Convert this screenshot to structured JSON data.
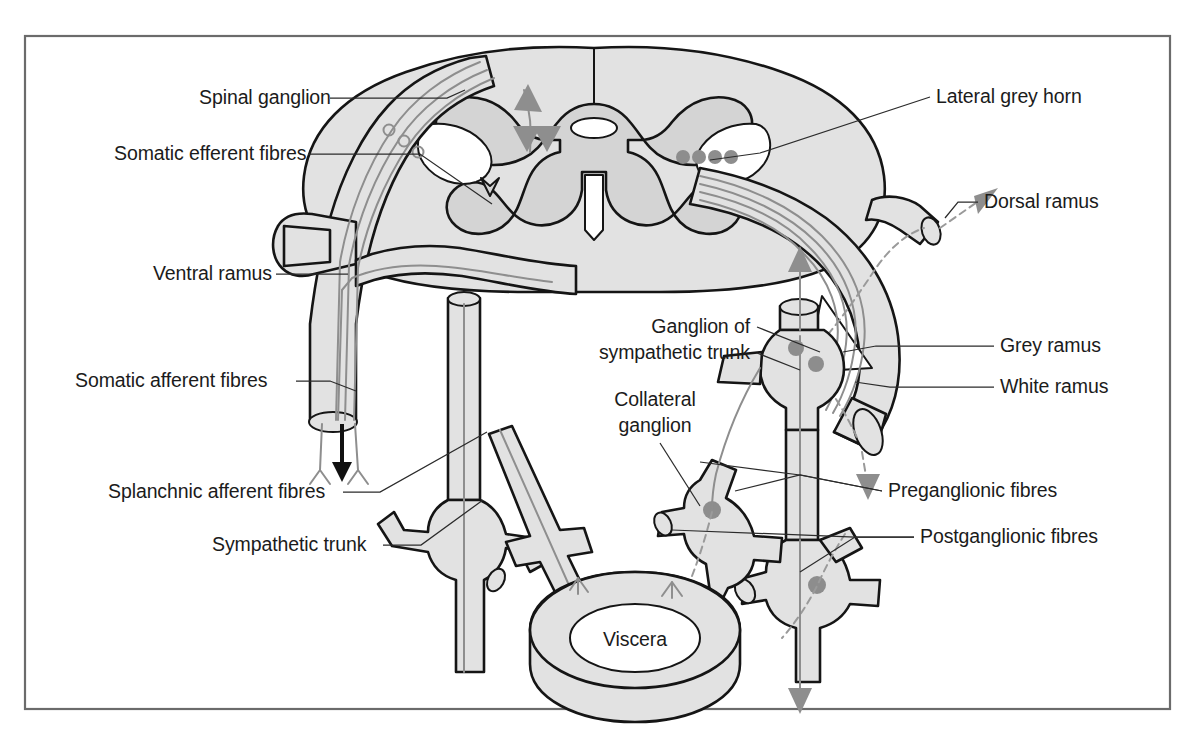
{
  "figure": {
    "border_color": "#6b6b6b",
    "background_color": "#ffffff"
  },
  "palette": {
    "nerve_fill": "#e2e2e2",
    "grey_matter": "#d4d4d4",
    "outline": "#151515",
    "fibre_grey": "#8e8e8e",
    "arrow_black": "#111111",
    "label_text": "#1b1b1b",
    "leader_line": "#2b2b2b"
  },
  "labels": [
    {
      "id": "spinal-ganglion",
      "text": "Spinal ganglion",
      "x": 199,
      "y": 104,
      "anchor": "start"
    },
    {
      "id": "somatic-efferent",
      "text": "Somatic efferent fibres",
      "x": 114,
      "y": 160,
      "anchor": "start"
    },
    {
      "id": "ventral-ramus",
      "text": "Ventral ramus",
      "x": 153,
      "y": 280,
      "anchor": "start"
    },
    {
      "id": "somatic-afferent",
      "text": "Somatic afferent fibres",
      "x": 75,
      "y": 387,
      "anchor": "start"
    },
    {
      "id": "splanchnic-afferent",
      "text": "Splanchnic afferent fibres",
      "x": 108,
      "y": 498,
      "anchor": "start"
    },
    {
      "id": "sympathetic-trunk",
      "text": "Sympathetic trunk",
      "x": 212,
      "y": 551,
      "anchor": "start"
    },
    {
      "id": "lateral-grey-horn",
      "text": "Lateral grey horn",
      "x": 936,
      "y": 103,
      "anchor": "start"
    },
    {
      "id": "dorsal-ramus",
      "text": "Dorsal ramus",
      "x": 984,
      "y": 208,
      "anchor": "start"
    },
    {
      "id": "grey-ramus",
      "text": "Grey ramus",
      "x": 1000,
      "y": 352,
      "anchor": "start"
    },
    {
      "id": "white-ramus",
      "text": "White ramus",
      "x": 1000,
      "y": 393,
      "anchor": "start"
    },
    {
      "id": "preganglionic-fibres",
      "text": "Preganglionic fibres",
      "x": 888,
      "y": 497,
      "anchor": "start"
    },
    {
      "id": "postganglionic-fibres",
      "text": "Postganglionic fibres",
      "x": 920,
      "y": 543,
      "anchor": "start"
    },
    {
      "id": "collateral-ganglion-1",
      "text": "Collateral",
      "x": 655,
      "y": 406,
      "anchor": "middle"
    },
    {
      "id": "collateral-ganglion-2",
      "text": "ganglion",
      "x": 655,
      "y": 432,
      "anchor": "middle"
    },
    {
      "id": "ganglion-symp-trunk-1",
      "text": "Ganglion of",
      "x": 750,
      "y": 333,
      "anchor": "end"
    },
    {
      "id": "ganglion-symp-trunk-2",
      "text": "sympathetic trunk",
      "x": 750,
      "y": 359,
      "anchor": "end"
    },
    {
      "id": "viscera",
      "text": "Viscera",
      "x": 635,
      "y": 646,
      "anchor": "middle"
    }
  ],
  "leader_lines": [
    {
      "id": "leader-spinal-ganglion",
      "points": "330,98 447,98 465,90"
    },
    {
      "id": "leader-somatic-efferent",
      "points": "308,154 420,154 492,204"
    },
    {
      "id": "leader-ventral-ramus",
      "points": "276,274 348,274"
    },
    {
      "id": "leader-somatic-afferent",
      "points": "296,381 330,381 356,391"
    },
    {
      "id": "leader-splanchnic-afferent",
      "points": "343,492 380,492 487,432"
    },
    {
      "id": "leader-sympathetic-trunk",
      "points": "383,545 421,545 483,500"
    },
    {
      "id": "leader-lateral-grey-horn",
      "points": "930,97 760,153 710,160"
    },
    {
      "id": "leader-dorsal-ramus",
      "points": "978,202 958,202 945,218"
    },
    {
      "id": "leader-grey-ramus",
      "points": "994,346 876,346 843,352"
    },
    {
      "id": "leader-white-ramus",
      "points": "994,387 890,387 855,382"
    },
    {
      "id": "leader-preganglionic-a",
      "points": "882,491 800,475 735,491"
    },
    {
      "id": "leader-preganglionic-b",
      "points": "882,491 800,475 700,462"
    },
    {
      "id": "leader-postganglionic-a",
      "points": "914,537 855,537 800,572"
    },
    {
      "id": "leader-postganglionic-b",
      "points": "914,537 855,537 672,530"
    },
    {
      "id": "leader-collateral-ganglion",
      "points": "660,443 700,506"
    },
    {
      "id": "leader-ganglion-symp-trunk",
      "points": "757,327 820,352"
    },
    {
      "id": "leader-ganglion-symp-trunk-2",
      "points": "757,353 800,370"
    }
  ],
  "anatomy": {
    "spinal_cord": {
      "name": "spinal-cord-cross-section",
      "grey_matter_name": "grey-matter-butterfly",
      "central_canal_name": "central-canal"
    },
    "cell_bodies": {
      "lateral_horn_count": 4,
      "spinal_ganglion_count": 3,
      "sympathetic_trunk_ganglion_count": 2,
      "collateral_ganglion_count": 1,
      "lower_ganglion_count": 1
    },
    "arrows": [
      {
        "id": "arrow-somatic-efferent-down",
        "direction": "down",
        "color": "#111111"
      },
      {
        "id": "arrow-dorsal-ramus-out",
        "direction": "up-right",
        "color": "#8e8e8e"
      },
      {
        "id": "arrow-ventral-ramus-down",
        "direction": "down",
        "color": "#8e8e8e"
      },
      {
        "id": "arrow-trunk-down",
        "direction": "down",
        "color": "#8e8e8e"
      },
      {
        "id": "arrow-trunk-up",
        "direction": "up",
        "color": "#8e8e8e"
      },
      {
        "id": "arrow-cord-afferent-in",
        "direction": "up",
        "color": "#8e8e8e"
      },
      {
        "id": "arrow-cord-afferent-branch",
        "direction": "down",
        "color": "#8e8e8e"
      }
    ],
    "viscera_ring_name": "viscera-torus"
  }
}
